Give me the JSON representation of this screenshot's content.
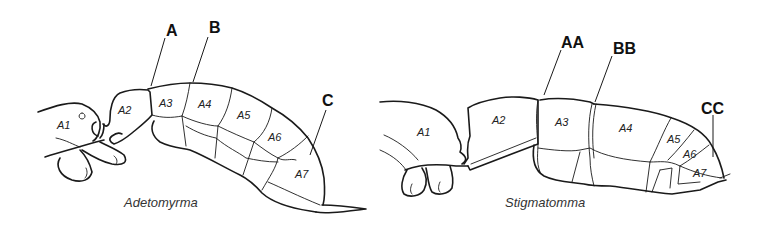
{
  "figure": {
    "panels": [
      {
        "genus": "Adetomyrma",
        "callouts": [
          "A",
          "B",
          "C"
        ],
        "segments": [
          "A1",
          "A2",
          "A3",
          "A4",
          "A5",
          "A6",
          "A7"
        ]
      },
      {
        "genus": "Stigmatomma",
        "callouts": [
          "AA",
          "BB",
          "CC"
        ],
        "segments": [
          "A1",
          "A2",
          "A3",
          "A4",
          "A5",
          "A6",
          "A7"
        ]
      }
    ]
  }
}
